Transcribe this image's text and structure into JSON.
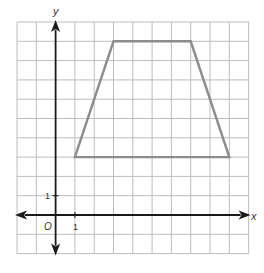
{
  "chart_data": {
    "type": "diagram",
    "title": "",
    "xlabel": "x",
    "ylabel": "y",
    "xlim": [
      -2,
      10
    ],
    "ylim": [
      -2,
      10
    ],
    "grid": true,
    "grid_step": 1,
    "origin_label": "O",
    "tick_labels": {
      "x": "1",
      "y": "1"
    },
    "shapes": [
      {
        "name": "trapezoid",
        "type": "polygon",
        "vertices": [
          [
            1,
            3
          ],
          [
            3,
            9
          ],
          [
            7,
            9
          ],
          [
            9,
            3
          ]
        ],
        "stroke": "#8c8c8c"
      }
    ]
  },
  "colors": {
    "grid": "#bdbdbd",
    "axis": "#1a1a1a",
    "shape": "#8c8c8c"
  },
  "labels": {
    "x_axis": "x",
    "y_axis": "y",
    "origin": "O",
    "x_tick_1": "1",
    "y_tick_1": "1"
  }
}
